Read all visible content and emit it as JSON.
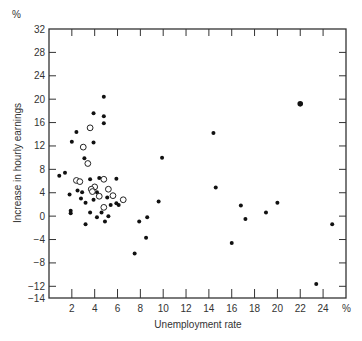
{
  "chart_data": {
    "type": "scatter",
    "title": "",
    "xlabel": "Unemployment rate",
    "ylabel": "Increase in hourly earnings",
    "x_unit": "%",
    "y_unit": "%",
    "xlim": [
      0,
      26
    ],
    "ylim": [
      -14,
      32
    ],
    "x_ticks": [
      2,
      4,
      6,
      8,
      10,
      12,
      14,
      16,
      18,
      20,
      22,
      24
    ],
    "y_ticks": [
      32,
      28,
      24,
      20,
      16,
      12,
      8,
      4,
      0,
      -4,
      -8,
      -12,
      -14
    ],
    "grid": false,
    "series": [
      {
        "name": "filled",
        "marker": "filled-circle",
        "points": [
          [
            4.8,
            20.4
          ],
          [
            3.9,
            17.6
          ],
          [
            4.8,
            17.1
          ],
          [
            4.8,
            15.9
          ],
          [
            2.4,
            14.4
          ],
          [
            2.0,
            12.7
          ],
          [
            3.9,
            12.6
          ],
          [
            3.1,
            9.9
          ],
          [
            0.9,
            6.9
          ],
          [
            1.4,
            7.4
          ],
          [
            4.4,
            6.5
          ],
          [
            3.6,
            6.3
          ],
          [
            5.9,
            6.4
          ],
          [
            1.8,
            3.7
          ],
          [
            2.5,
            4.4
          ],
          [
            2.9,
            4.1
          ],
          [
            3.2,
            2.3
          ],
          [
            3.9,
            2.8
          ],
          [
            4.2,
            4.1
          ],
          [
            5.1,
            3.2
          ],
          [
            5.4,
            1.9
          ],
          [
            6.1,
            1.9
          ],
          [
            1.9,
            0.9
          ],
          [
            1.9,
            0.5
          ],
          [
            3.6,
            0.6
          ],
          [
            4.2,
            -0.2
          ],
          [
            4.6,
            0.6
          ],
          [
            5.2,
            0.0
          ],
          [
            4.9,
            -0.9
          ],
          [
            3.2,
            -1.4
          ],
          [
            2.8,
            3.0
          ],
          [
            5.9,
            2.2
          ],
          [
            14.4,
            14.2
          ],
          [
            9.9,
            10.0
          ],
          [
            14.6,
            4.9
          ],
          [
            9.6,
            2.5
          ],
          [
            8.6,
            -0.2
          ],
          [
            7.9,
            -0.9
          ],
          [
            8.5,
            -3.7
          ],
          [
            7.5,
            -6.4
          ],
          [
            16.0,
            -4.6
          ],
          [
            16.8,
            1.8
          ],
          [
            17.2,
            -0.5
          ],
          [
            19.0,
            0.6
          ],
          [
            20.0,
            2.3
          ],
          [
            24.8,
            -1.4
          ],
          [
            23.4,
            -11.6
          ]
        ]
      },
      {
        "name": "open",
        "marker": "open-circle",
        "points": [
          [
            3.6,
            15.1
          ],
          [
            3.0,
            11.8
          ],
          [
            3.4,
            9.0
          ],
          [
            2.4,
            6.1
          ],
          [
            2.7,
            5.9
          ],
          [
            4.8,
            6.3
          ],
          [
            4.0,
            5.0
          ],
          [
            3.7,
            4.6
          ],
          [
            3.8,
            4.2
          ],
          [
            5.2,
            4.6
          ],
          [
            5.6,
            3.5
          ],
          [
            6.5,
            2.8
          ],
          [
            4.8,
            1.5
          ],
          [
            4.4,
            3.4
          ]
        ]
      },
      {
        "name": "large-filled",
        "marker": "large-filled-circle",
        "points": [
          [
            22.0,
            19.2
          ]
        ]
      }
    ]
  },
  "axes": {
    "y_unit_label": "%",
    "x_unit_label": "%",
    "x_title": "Unemployment rate",
    "y_title": "Increase in hourly earnings"
  }
}
